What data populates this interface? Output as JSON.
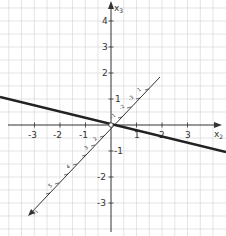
{
  "diagram": {
    "type": "3d-coordinate-system-with-line",
    "axes": {
      "x2": {
        "label": "x2",
        "ticks": [
          "-3",
          "-2",
          "-1",
          "1",
          "2",
          "3"
        ]
      },
      "x3": {
        "label": "x3",
        "ticks": [
          "4",
          "3",
          "2",
          "1",
          "-1",
          "-2",
          "-3"
        ]
      },
      "x1": {
        "label": "x1",
        "ticks": [
          "-1",
          "-2",
          "-3",
          "1",
          "2",
          "3",
          "4",
          "5"
        ]
      }
    },
    "line": {
      "description": "thick line through origin",
      "color": "#222222"
    },
    "colors": {
      "grid": "#d4d4d4",
      "axis": "#333333",
      "line": "#222222"
    }
  }
}
